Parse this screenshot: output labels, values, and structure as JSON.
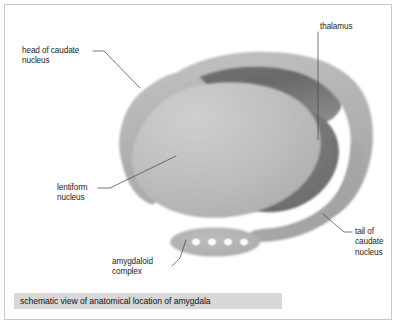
{
  "figure": {
    "caption": "schematic view of anatomical location of amygdala",
    "background_color": "#ffffff",
    "frame_color": "#c9c9c9",
    "caption_band_color": "#d8d8d8"
  },
  "labels": {
    "head_of_caudate_nucleus": "head of caudate\nnucleus",
    "thalamus": "thalamus",
    "lentiform_nucleus": "lentiform\nnucleus",
    "amygdaloid_complex": "amygdaloid\ncomplex",
    "tail_of_caudate_nucleus": "tail of\ncaudate\nnucleus"
  },
  "structures": {
    "caudate_ring": {
      "name": "caudate nucleus ring",
      "color": "#b3b3b3"
    },
    "thalamus_body": {
      "name": "thalamus",
      "color": "#6f6f6f"
    },
    "lentiform_body": {
      "name": "lentiform nucleus",
      "color": "#bdbdbd"
    },
    "caudate_tail": {
      "name": "tail of caudate nucleus",
      "color": "#a8a8a8"
    },
    "amygdala": {
      "name": "amygdaloid complex",
      "color": "#b0b0b0",
      "nuclei_count": 4,
      "nuclei_color": "#ffffff"
    }
  },
  "leader_line_color": "#4a4a4a"
}
